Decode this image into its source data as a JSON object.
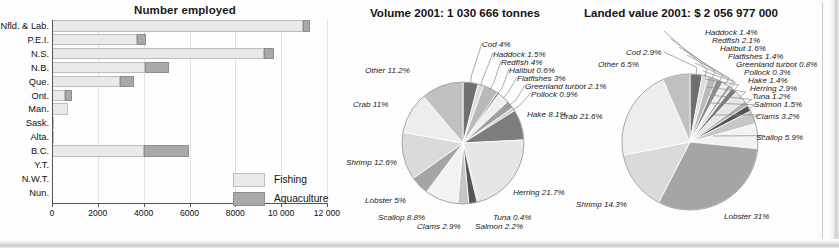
{
  "bar_chart": {
    "title": "Number employed",
    "legend": [
      {
        "key": "fishing",
        "label": "Fishing",
        "color": "#e9e9e9"
      },
      {
        "key": "aquaculture",
        "label": "Aquaculture",
        "color": "#a9a9a9"
      }
    ],
    "axis": {
      "ticks": [
        "0",
        "2000",
        "4000",
        "6000",
        "8000",
        "10 000",
        "12 000"
      ],
      "tick_values": [
        0,
        2000,
        4000,
        6000,
        8000,
        10000,
        12000
      ],
      "min": 0,
      "max": 12000
    },
    "categories": [
      "Nfld. & Lab.",
      "P.E.I.",
      "N.S.",
      "N.B.",
      "Que.",
      "Ont.",
      "Man.",
      "Sask.",
      "Alta.",
      "B.C.",
      "Y.T.",
      "N.W.T.",
      "Nun."
    ],
    "series": [
      {
        "name": "Fishing",
        "values": [
          10950,
          3700,
          9250,
          4050,
          2950,
          560,
          700,
          60,
          60,
          4000,
          0,
          0,
          0
        ]
      },
      {
        "name": "Aquaculture",
        "values": [
          300,
          400,
          450,
          1050,
          650,
          330,
          0,
          0,
          0,
          2000,
          0,
          0,
          0
        ]
      }
    ]
  },
  "chart_data": [
    {
      "type": "bar",
      "title": "Number employed",
      "stacked": true,
      "orientation": "horizontal",
      "categories": [
        "Nfld. & Lab.",
        "P.E.I.",
        "N.S.",
        "N.B.",
        "Que.",
        "Ont.",
        "Man.",
        "Sask.",
        "Alta.",
        "B.C.",
        "Y.T.",
        "N.W.T.",
        "Nun."
      ],
      "series": [
        {
          "name": "Fishing",
          "values": [
            10950,
            3700,
            9250,
            4050,
            2950,
            560,
            700,
            60,
            60,
            4000,
            0,
            0,
            0
          ]
        },
        {
          "name": "Aquaculture",
          "values": [
            300,
            400,
            450,
            1050,
            650,
            330,
            0,
            0,
            0,
            2000,
            0,
            0,
            0
          ]
        }
      ],
      "xlabel": "",
      "ylabel": "",
      "xlim": [
        0,
        12000
      ],
      "grid": true,
      "legend_position": "inside-bottom-right"
    },
    {
      "type": "pie",
      "title": "Volume 2001: 1 030 666 tonnes",
      "labels": [
        "Cod",
        "Haddock",
        "Redfish",
        "Halibut",
        "Flatfishes",
        "Greenland turbot",
        "Pollock",
        "Hake",
        "Crab",
        "Herring",
        "Tuna",
        "Salmon",
        "Clams",
        "Scallop",
        "Lobster",
        "Shrimp",
        "Other"
      ],
      "values": [
        4,
        1.5,
        4,
        0.6,
        3,
        2.1,
        0.9,
        8.1,
        11,
        21.7,
        0.4,
        2.2,
        2.9,
        8.8,
        5,
        12.6,
        11.2
      ],
      "unit": "%"
    },
    {
      "type": "pie",
      "title": "Landed value 2001: $ 2 056 977 000",
      "labels": [
        "Cod",
        "Haddock",
        "Redfish",
        "Halibut",
        "Flatfishes",
        "Greenland turbot",
        "Pollock",
        "Hake",
        "Herring",
        "Tuna",
        "Salmon",
        "Clams",
        "Scallop",
        "Lobster",
        "Shrimp",
        "Crab",
        "Other"
      ],
      "values": [
        2.9,
        1.4,
        2.1,
        1.6,
        1.4,
        0.8,
        0.3,
        1.4,
        2.9,
        1.2,
        1.5,
        3.2,
        5.9,
        31,
        14.3,
        21.6,
        6.5
      ],
      "unit": "%"
    }
  ],
  "pie_volume": {
    "title": "Volume 2001: 1 030 666 tonnes",
    "labels": {
      "cod": "Cod 4%",
      "haddock": "Haddock 1.5%",
      "redfish": "Redfish 4%",
      "halibut": "Halibut 0.6%",
      "flatfishes": "Flatfishes 3%",
      "turbot": "Greenland turbot 2.1%",
      "pollock": "Pollock 0.9%",
      "hake": "Hake 8.1%",
      "herring": "Herring  21.7%",
      "tuna": "Tuna 0.4%",
      "salmon": "Salmon 2.2%",
      "clams": "Clams 2.9%",
      "scallop": "Scallop 8.8%",
      "lobster": "Lobster 5%",
      "shrimp": "Shrimp 12.6%",
      "crab": "Crab 11%",
      "other": "Other 11.2%"
    }
  },
  "pie_value": {
    "title": "Landed value 2001: $ 2 056 977 000",
    "labels": {
      "cod": "Cod 2.9%",
      "haddock": "Haddock 1.4%",
      "redfish": "Redfish 2.1%",
      "halibut": "Halibut 1.6%",
      "flatfishes": "Flatfishes 1.4%",
      "turbot": "Greenland turbot 0.8%",
      "pollock": "Pollock 0.3%",
      "hake": "Hake 1.4%",
      "herring": "Herring 2.9%",
      "tuna": "Tuna 1.2%",
      "salmon": "Salmon 1.5%",
      "clams": "Clams 3.2%",
      "scallop": "Scallop 5.9%",
      "lobster": "Lobster 31%",
      "shrimp": "Shrimp 14.3%",
      "crab": "Crab 21.6%",
      "other": "Other 6.5%"
    }
  }
}
